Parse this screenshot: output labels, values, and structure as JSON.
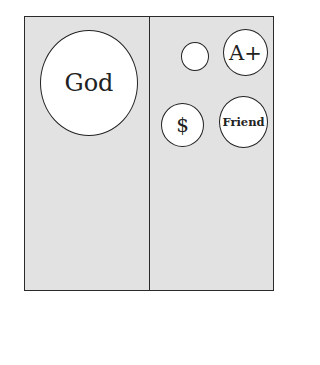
{
  "diagram": {
    "panels": [
      {
        "name": "left",
        "circles": [
          {
            "label": "God",
            "size": "large"
          }
        ]
      },
      {
        "name": "right",
        "circles": [
          {
            "label": "",
            "size": "small"
          },
          {
            "label": "A+",
            "size": "medium"
          },
          {
            "label": "$",
            "size": "medium"
          },
          {
            "label": "Friend",
            "size": "medium"
          }
        ]
      }
    ],
    "colors": {
      "panel_fill": "#e2e2e2",
      "circle_fill": "#ffffff",
      "stroke": "#222222"
    }
  }
}
